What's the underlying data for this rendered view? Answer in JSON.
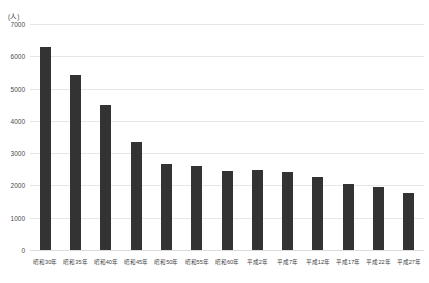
{
  "chart_data": {
    "type": "bar",
    "title": "",
    "subtitle": "",
    "xlabel": "",
    "ylabel": "",
    "unit_label": "(人)",
    "categories": [
      "昭和30年",
      "昭和35年",
      "昭和40年",
      "昭和45年",
      "昭和50年",
      "昭和55年",
      "昭和60年",
      "平成2年",
      "平成7年",
      "平成12年",
      "平成17年",
      "平成22年",
      "平成27年"
    ],
    "values": [
      6300,
      5430,
      4500,
      3350,
      2670,
      2600,
      2460,
      2480,
      2410,
      2250,
      2060,
      1960,
      1760
    ],
    "ylim": [
      0,
      7000
    ],
    "yticks": [
      0,
      1000,
      2000,
      3000,
      4000,
      5000,
      6000,
      7000
    ],
    "ytick_labels": [
      "0",
      "1000",
      "2000",
      "3000",
      "4000",
      "5000",
      "6000",
      "7000"
    ],
    "grid": true,
    "legend": false,
    "legend_position": "none",
    "bar_color": "#333333",
    "gridline_color": "#e4e7ea",
    "background_color": "#ffffff"
  }
}
